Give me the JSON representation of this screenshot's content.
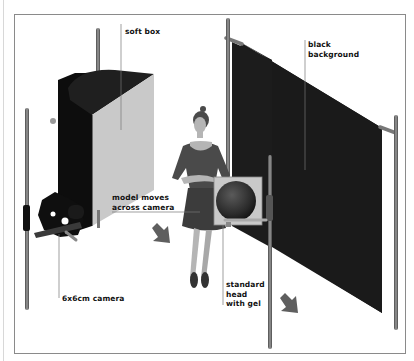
{
  "diagram": {
    "colors": {
      "frame": "#8a8a8a",
      "softbox_body": "#0d0d0d",
      "softbox_face": "#c8c8c8",
      "background_cloth": "#1a1a1a",
      "pole": "#6e6e6e",
      "arrow": "#5f5f5f",
      "model_dress": "#4a4a4a",
      "model_skin": "#b8b8b8"
    },
    "labels": {
      "soft_box": "soft box",
      "black_background_line1": "black",
      "black_background_line2": "background",
      "model_moves_line1": "model moves",
      "model_moves_line2": "across camera",
      "camera": "6x6cm camera",
      "head_line1": "standard",
      "head_line2": "head",
      "head_line3": "with gel"
    },
    "elements": [
      {
        "name": "soft box",
        "icon": "softbox-icon"
      },
      {
        "name": "black background",
        "icon": "backdrop-icon"
      },
      {
        "name": "model",
        "icon": "dancer-figure-icon"
      },
      {
        "name": "6x6cm camera",
        "icon": "camera-icon"
      },
      {
        "name": "standard head with gel",
        "icon": "studio-light-icon"
      },
      {
        "name": "movement arrows",
        "icon": "arrow-down-right-icon",
        "count": 2
      }
    ]
  }
}
